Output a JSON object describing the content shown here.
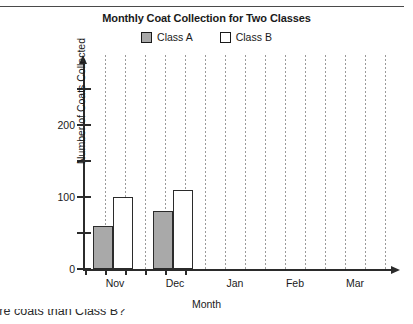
{
  "chart_data": {
    "type": "bar",
    "title": "Monthly Coat Collection for Two Classes",
    "xlabel": "Month",
    "ylabel": "Number of Coats Collected",
    "categories": [
      "Nov",
      "Dec",
      "Jan",
      "Feb",
      "Mar"
    ],
    "series": [
      {
        "name": "Class A",
        "color": "#a9a9a9",
        "values": [
          60,
          80,
          0,
          0,
          0
        ]
      },
      {
        "name": "Class B",
        "color": "#ffffff",
        "values": [
          100,
          110,
          0,
          0,
          0
        ]
      }
    ],
    "ylim": [
      0,
      265
    ],
    "yticks": [
      0,
      50,
      100,
      150,
      200,
      250
    ],
    "ytick_labels": [
      "0",
      "",
      "100",
      "",
      "200",
      ""
    ],
    "grid": true,
    "grid_orientation": "vertical",
    "legend_position": "top-center",
    "axis_arrows": true
  },
  "legend": {
    "items": [
      {
        "label": "Class A",
        "swatch": "#a9a9a9"
      },
      {
        "label": "Class B",
        "swatch": "#ffffff"
      }
    ]
  },
  "footer": {
    "cut_off_text": "more coats than Class B?"
  }
}
